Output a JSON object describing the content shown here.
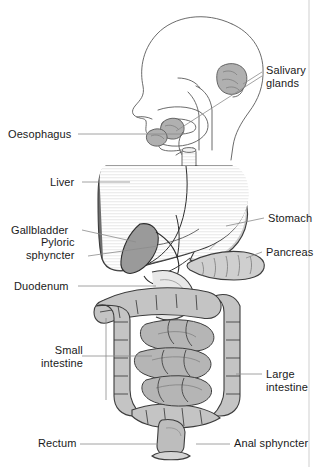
{
  "figure": {
    "style": "grayscale line diagram with leader-line labels",
    "background_color": "#ffffff",
    "line_color": "#3c3c3c",
    "text_color": "#1a1a1a",
    "leader_color": "#8c8c8c"
  },
  "labels_left": [
    {
      "id": "oesophagus",
      "text": "Oesophagus",
      "x": 8,
      "y": 128
    },
    {
      "id": "liver",
      "text": "Liver",
      "x": 50,
      "y": 176
    },
    {
      "id": "gallbladder",
      "text": "Gallbladder",
      "x": 11,
      "y": 224
    },
    {
      "id": "pyloric-sphyncter",
      "text": "Pyloric\nsphyncter",
      "x": 26,
      "y": 236
    },
    {
      "id": "duodenum",
      "text": "Duodenum",
      "x": 14,
      "y": 280
    },
    {
      "id": "small-intestine",
      "text": "Small\nintestine",
      "x": 41,
      "y": 344
    },
    {
      "id": "rectum",
      "text": "Rectum",
      "x": 38,
      "y": 437
    }
  ],
  "labels_right": [
    {
      "id": "salivary-glands",
      "text": "Salivary\nglands",
      "x": 266,
      "y": 64
    },
    {
      "id": "stomach",
      "text": "Stomach",
      "x": 268,
      "y": 212
    },
    {
      "id": "pancreas",
      "text": "Pancreas",
      "x": 266,
      "y": 246
    },
    {
      "id": "large-intestine",
      "text": "Large\nintestine",
      "x": 266,
      "y": 368
    },
    {
      "id": "anal-sphyncter",
      "text": "Anal sphyncter",
      "x": 234,
      "y": 437
    }
  ],
  "organ_tones": {
    "liver": "#6e6e6e",
    "stomach": "#c9c9c9",
    "gallbladder": "#9a9a9a",
    "pancreas": "#cfcfcf",
    "large_intestine": "#c4c4c4",
    "small_intestine": "#b5b5b5",
    "salivary_gland": "#b0b0b0",
    "head_outline": "#ffffff",
    "oesophagus": "#e0e0e0",
    "rectum": "#bdbdbd"
  }
}
